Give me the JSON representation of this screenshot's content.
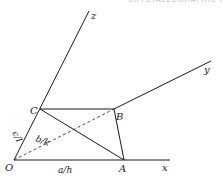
{
  "header_fragment": "CRYSTALLOGRAPHIC PLANES",
  "diagram": {
    "type": "crystallographic-plane-intercepts",
    "points": {
      "O": {
        "label": "O",
        "x": 14,
        "y": 160
      },
      "A": {
        "label": "A",
        "x": 124,
        "y": 160
      },
      "B": {
        "label": "B",
        "x": 114,
        "y": 109
      },
      "C": {
        "label": "C",
        "x": 40,
        "y": 109
      }
    },
    "axes": {
      "x": {
        "label": "x",
        "end": [
          170,
          160
        ]
      },
      "y": {
        "label": "y",
        "end": [
          211,
          61
        ]
      },
      "z": {
        "label": "z",
        "end": [
          89,
          11
        ]
      }
    },
    "intercept_labels": {
      "a": "a/h",
      "b": "b/k",
      "c": "c/l"
    },
    "colors": {
      "line": "#1a1a1a",
      "background": "#ffffff"
    }
  }
}
